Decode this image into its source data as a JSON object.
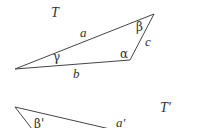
{
  "diagram": {
    "background": "#ffffff",
    "line_color": "#444444",
    "text_color": "#333333",
    "triangles": [
      {
        "name": "T",
        "label": "T",
        "label_pos": [
          51,
          17
        ],
        "vertices": [
          [
            15,
            69
          ],
          [
            154,
            14
          ],
          [
            130,
            60
          ]
        ],
        "sides": [
          {
            "label": "a",
            "pos": [
              80,
              37
            ]
          },
          {
            "label": "b",
            "pos": [
              73,
              78
            ]
          },
          {
            "label": "c",
            "pos": [
              145,
              46
            ]
          }
        ],
        "angles": [
          {
            "label": "γ",
            "pos": [
              53,
              61
            ]
          },
          {
            "label": "β",
            "pos": [
              136,
              31
            ]
          },
          {
            "label": "α",
            "pos": [
              120,
              58
            ]
          }
        ]
      },
      {
        "name": "T'",
        "label": "T'",
        "label_pos": [
          160,
          112
        ],
        "vertices": [
          [
            15,
            107
          ],
          [
            110,
            128
          ],
          [
            32,
            128
          ]
        ],
        "sides": [
          {
            "label": "a'",
            "pos": [
              116,
              128
            ]
          }
        ],
        "angles": [
          {
            "label": "β'",
            "pos": [
              34,
              128
            ]
          }
        ]
      }
    ]
  }
}
